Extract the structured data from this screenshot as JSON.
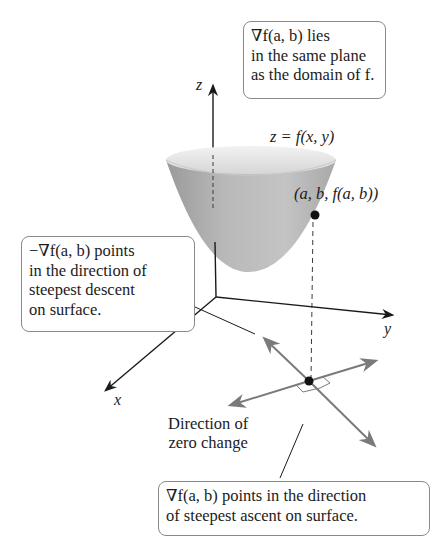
{
  "diagram": {
    "surface_label": "z = f(x, y)",
    "point_label": "(a, b, f(a, b))",
    "axes": {
      "x": "x",
      "y": "y",
      "z": "z"
    },
    "callouts": {
      "top_right": {
        "lines": [
          "∇f(a, b) lies",
          "in the same plane",
          "as the domain of f."
        ]
      },
      "left": {
        "lines": [
          "−∇f(a, b) points",
          "in the direction of",
          "steepest descent",
          "on surface."
        ]
      },
      "bottom": {
        "lines": [
          "∇f(a, b) points in the direction",
          "of steepest ascent on surface."
        ]
      }
    },
    "zero_change_label": {
      "lines": [
        "Direction of",
        "zero change"
      ]
    },
    "colors": {
      "surface": "#b5b5b5",
      "surface_rim": "#e2e2e2",
      "gradient_arrows": "#7a7a7a",
      "axes": "#1a1a1a",
      "callout_border": "#8a8a8a"
    }
  }
}
